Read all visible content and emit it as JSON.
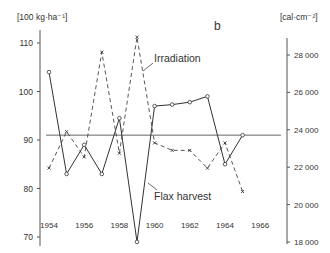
{
  "chart_data": {
    "type": "line",
    "panel_label": "b",
    "x": [
      1954,
      1955,
      1956,
      1957,
      1958,
      1959,
      1960,
      1961,
      1962,
      1963,
      1964,
      1965
    ],
    "x_tick_labels": [
      "1954",
      "1956",
      "1958",
      "1960",
      "1962",
      "1964",
      "1966"
    ],
    "left_axis": {
      "unit_label": "[100 kg·ha⁻¹]",
      "ticks": [
        70,
        80,
        90,
        100,
        110
      ],
      "ylim": [
        69,
        112
      ]
    },
    "right_axis": {
      "unit_label": "[cal·cm⁻²]",
      "ticks": [
        18000,
        20000,
        22000,
        24000,
        26000,
        28000
      ],
      "tick_labels": [
        "18 000",
        "20 000",
        "22 000",
        "24 000",
        "26 000",
        "28 000"
      ],
      "ylim": [
        18000,
        29000
      ]
    },
    "reference_line": {
      "axis": "left",
      "value": 91
    },
    "series": [
      {
        "name": "Flax harvest",
        "axis": "left",
        "style": "solid",
        "marker": "circle",
        "values": [
          104,
          83,
          89,
          83,
          94.5,
          69,
          97,
          97.3,
          97.8,
          99,
          85,
          91
        ]
      },
      {
        "name": "Irradiation",
        "axis": "right",
        "style": "dashed",
        "marker": "x",
        "values": [
          21950,
          23900,
          22550,
          28150,
          22750,
          28950,
          23300,
          22900,
          22900,
          21950,
          23300,
          20700
        ]
      }
    ],
    "annotations": [
      {
        "text": "Irradiation",
        "points_to": "Irradiation series"
      },
      {
        "text": "Flax harvest",
        "points_to": "Flax harvest series"
      }
    ],
    "grid": false,
    "legend": "inline annotations"
  }
}
